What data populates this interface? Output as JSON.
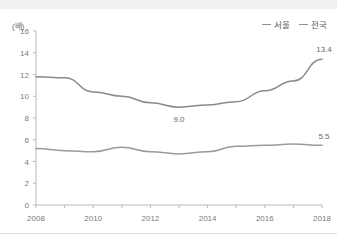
{
  "chart_data": {
    "type": "line",
    "title": "",
    "xlabel": "",
    "ylabel": "",
    "unit_label": "(배)",
    "x": [
      2008,
      2009,
      2010,
      2011,
      2012,
      2013,
      2014,
      2015,
      2016,
      2017,
      2018
    ],
    "xtick_labels": [
      "2008",
      "2010",
      "2012",
      "2014",
      "2016",
      "2018"
    ],
    "xtick_values": [
      2008,
      2010,
      2012,
      2014,
      2016,
      2018
    ],
    "xlim": [
      2008,
      2018
    ],
    "ytick_labels": [
      "0",
      "2",
      "4",
      "6",
      "8",
      "10",
      "12",
      "14",
      "16"
    ],
    "ytick_values": [
      0,
      2,
      4,
      6,
      8,
      10,
      12,
      14,
      16
    ],
    "ylim": [
      0,
      16
    ],
    "grid": false,
    "legend_position": "top-right",
    "series": [
      {
        "name": "서울",
        "color": "#8a8a8a",
        "values": [
          11.8,
          11.7,
          10.4,
          10.0,
          9.4,
          9.0,
          9.2,
          9.5,
          10.5,
          11.4,
          13.4
        ]
      },
      {
        "name": "전국",
        "color": "#9a9a9a",
        "values": [
          5.2,
          5.0,
          4.9,
          5.3,
          4.9,
          4.7,
          4.9,
          5.4,
          5.5,
          5.6,
          5.5
        ]
      }
    ],
    "annotations": [
      {
        "text": "13.4",
        "series": "서울",
        "x": 2018,
        "y": 13.4
      },
      {
        "text": "9.0",
        "series": "서울",
        "x": 2013,
        "y": 9.0
      },
      {
        "text": "5.5",
        "series": "전국",
        "x": 2018,
        "y": 5.5
      }
    ]
  },
  "legend": {
    "items": [
      {
        "label": "서울"
      },
      {
        "label": "전국"
      }
    ]
  }
}
